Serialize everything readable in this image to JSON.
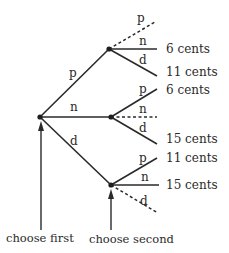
{
  "diagram": {
    "type": "tree",
    "root": {
      "id": "root",
      "children": [
        {
          "edge_label": "p",
          "id": "after-p",
          "children": [
            {
              "edge_label": "p",
              "style": "dashed",
              "outcome": ""
            },
            {
              "edge_label": "n",
              "style": "solid",
              "outcome": "6 cents"
            },
            {
              "edge_label": "d",
              "style": "solid",
              "outcome": "11 cents"
            }
          ]
        },
        {
          "edge_label": "n",
          "id": "after-n",
          "children": [
            {
              "edge_label": "p",
              "style": "solid",
              "outcome": "6 cents"
            },
            {
              "edge_label": "n",
              "style": "dashed",
              "outcome": ""
            },
            {
              "edge_label": "d",
              "style": "solid",
              "outcome": "15 cents"
            }
          ]
        },
        {
          "edge_label": "d",
          "id": "after-d",
          "children": [
            {
              "edge_label": "p",
              "style": "solid",
              "outcome": "11 cents"
            },
            {
              "edge_label": "n",
              "style": "solid",
              "outcome": "15 cents"
            },
            {
              "edge_label": "d",
              "style": "dashed",
              "outcome": ""
            }
          ]
        }
      ]
    },
    "captions": {
      "first": "choose first",
      "second": "choose second"
    }
  }
}
